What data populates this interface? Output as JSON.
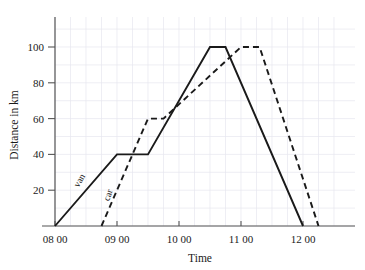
{
  "chart_data": {
    "type": "line",
    "title": "",
    "xlabel": "Time",
    "ylabel": "Distance in km",
    "xlim": [
      8.0,
      12.6
    ],
    "ylim": [
      0,
      113
    ],
    "grid": true,
    "grid_x_step_hours": 0.25,
    "grid_y_step_km": 10,
    "legend": "inline-labels",
    "x_ticks": [
      {
        "value": 8,
        "label": "08 00"
      },
      {
        "value": 9,
        "label": "09 00"
      },
      {
        "value": 10,
        "label": "10 00"
      },
      {
        "value": 11,
        "label": "11 00"
      },
      {
        "value": 12,
        "label": "12 00"
      }
    ],
    "y_ticks": [
      {
        "value": 20,
        "label": "20"
      },
      {
        "value": 40,
        "label": "40"
      },
      {
        "value": 60,
        "label": "60"
      },
      {
        "value": 80,
        "label": "80"
      },
      {
        "value": 100,
        "label": "100"
      }
    ],
    "series": [
      {
        "name": "van",
        "label": "van",
        "style": "solid",
        "color": "#1a1a1a",
        "points": [
          {
            "t": 8.0,
            "km": 0
          },
          {
            "t": 9.0,
            "km": 40
          },
          {
            "t": 9.5,
            "km": 40
          },
          {
            "t": 10.5,
            "km": 100
          },
          {
            "t": 10.75,
            "km": 100
          },
          {
            "t": 12.0,
            "km": 0
          }
        ]
      },
      {
        "name": "car",
        "label": "car",
        "style": "dashed",
        "color": "#1a1a1a",
        "points": [
          {
            "t": 8.75,
            "km": 0
          },
          {
            "t": 9.5,
            "km": 60
          },
          {
            "t": 9.75,
            "km": 60
          },
          {
            "t": 11.0,
            "km": 100
          },
          {
            "t": 11.3,
            "km": 100
          },
          {
            "t": 12.25,
            "km": 0
          }
        ]
      }
    ]
  }
}
